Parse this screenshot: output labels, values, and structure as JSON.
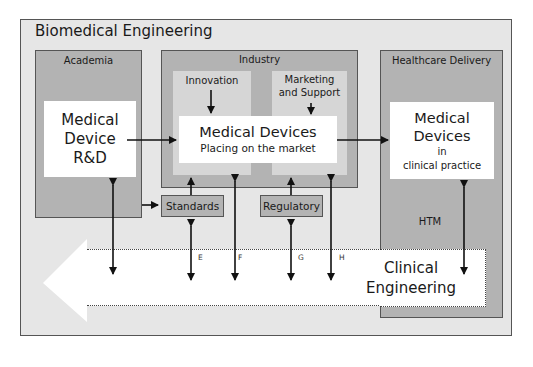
{
  "diagram": {
    "title": "Biomedical Engineering",
    "domains": [
      {
        "id": "academia",
        "label": "Academia",
        "content": [
          "Medical",
          "Device",
          "R&D"
        ]
      },
      {
        "id": "industry",
        "label": "Industry",
        "sub_areas": [
          "Innovation",
          "Marketing and Support"
        ],
        "marketing_lines": [
          "Marketing",
          "and Support"
        ],
        "content_title": "Medical Devices",
        "content_subtitle": "Placing on the market"
      },
      {
        "id": "healthcare",
        "label": "Healthcare Delivery",
        "content_lines": [
          "Medical",
          "Devices",
          "in",
          "clinical practice"
        ],
        "sub_label": "HTM"
      }
    ],
    "boxes": {
      "standards": "Standards",
      "regulatory": "Regulatory"
    },
    "clinical_engineering": [
      "Clinical",
      "Engineering"
    ],
    "link_labels": {
      "e": "E",
      "f": "F",
      "g": "G",
      "h": "H"
    },
    "colors": {
      "outer_bg": "#e6e6e6",
      "panel_bg": "#b3b3b3",
      "sub_bg": "#d6d6d6",
      "content_bg": "#ffffff",
      "border": "#555555",
      "arrow": "#111111"
    }
  }
}
